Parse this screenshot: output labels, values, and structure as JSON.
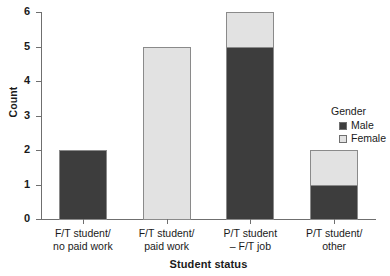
{
  "chart_data": {
    "type": "bar",
    "subtype": "stacked-bar",
    "title": "",
    "xlabel": "Student status",
    "ylabel": "Count",
    "ylim": [
      0,
      6
    ],
    "yticks": [
      0,
      1,
      2,
      3,
      4,
      5,
      6
    ],
    "grid": false,
    "categories": [
      "F/T student/ no paid work",
      "F/T student/ paid work",
      "P/T student – F/T job",
      "P/T student/ other"
    ],
    "category_lines": [
      [
        "F/T student/",
        "no paid work"
      ],
      [
        "F/T student/",
        "paid work"
      ],
      [
        "P/T student",
        "– F/T job"
      ],
      [
        "P/T student/",
        "other"
      ]
    ],
    "series": [
      {
        "name": "Male",
        "color": "#3d3d3d",
        "values": [
          2,
          0,
          5,
          1
        ]
      },
      {
        "name": "Female",
        "color": "#e2e2e2",
        "values": [
          0,
          5,
          1,
          1
        ]
      }
    ],
    "totals": [
      2,
      5,
      6,
      2
    ],
    "legend": {
      "title": "Gender",
      "position": "right",
      "entries": [
        {
          "label": "Male",
          "color": "#3d3d3d"
        },
        {
          "label": "Female",
          "color": "#e2e2e2"
        }
      ]
    },
    "axis_color": "#6f6f6f",
    "bar_border_color": "#8a8a8a"
  }
}
